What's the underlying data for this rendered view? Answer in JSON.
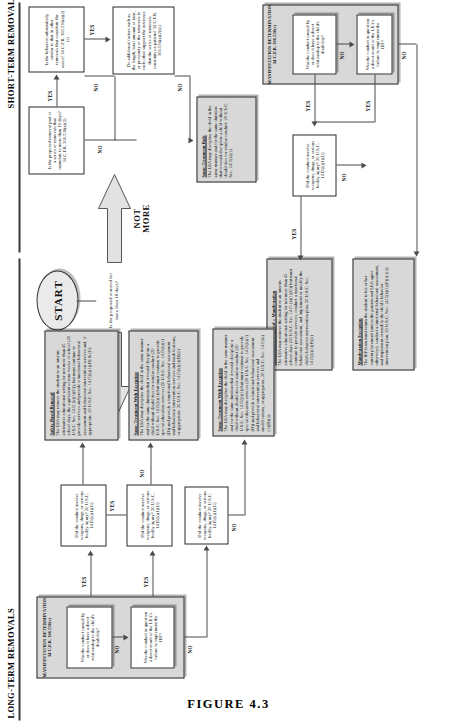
{
  "figure": {
    "caption": "FIGURE 4.3"
  },
  "bands": {
    "short_term": "SHORT-TERM REMOVALS",
    "long_term": "LONG-TERM REMOVALS"
  },
  "start": {
    "label": "START"
  },
  "split": {
    "more_label": "MORE",
    "not_more_label": "NOT\nMORE",
    "question": "Is the proposed removal for more than 10 days?"
  },
  "nodes": {
    "q_cumulate": {
      "text": "Is the proposed removal part of a series of removals that cumulate to more than 10 days? 34 C.F.R. 300.536(a)(2)"
    },
    "q_similar_behavior": {
      "text": "Is the behavior substantially similar to that in other removals that constitute the series? 34 C.F.R. 300.536(a)(2)(i)"
    },
    "q_additional_factors": {
      "text": "Do additional factors such as the length, total amount of time, or proximity of the removals to each other support the inference that the series of removals constitutes a pattern? 34 C.F.R. 300.536(a)(2)(ii)"
    },
    "q_caused_by_disability_short": {
      "text": "Was the conduct caused by or does it have a direct relationship to the child's disability?"
    },
    "q_failure_iep_short": {
      "text": "Was the conduct in question a direct result of the LEA's failure to implement the IEP?"
    },
    "q_weapons_short": {
      "text": "Did the conduct involve weapons, drugs, or serious bodily injury? 20 U.S.C. 1415(k)(1)(G)"
    },
    "q_caused_by_disability_long": {
      "text": "Was the conduct caused by or does it have a direct relationship to the child's disability?"
    },
    "q_failure_iep_long": {
      "text": "Was the conduct in question a direct result of the LEA's failure to implement the IEP?"
    },
    "q_weapons_long": {
      "text": "Did the conduct involve weapons, drugs, or serious bodily injury? 20 U.S.C. 1415(k)(1)(G)"
    }
  },
  "groups": {
    "md_short": {
      "title": "MANIFESTATION DETERMINATION\n34 C.F.R. 300.530(e)"
    },
    "md_long": {
      "title": "MANIFESTATION DETERMINATION\n34 C.F.R. 300.530(e)"
    }
  },
  "notes": {
    "same_treatment_rule": {
      "heading": "Same-Treatment Rule",
      "body": "The LEA may discipline the child in the same manner and for the same duration that it would discipline a child without disabilities for similar conduct. 20 U.S.C. Sec. 1415(k)(1)"
    },
    "safety_based_removal_manifestation": {
      "heading": "Safety-Based Removal + Manifestation",
      "body": "The LEA may remove the student to an interim alternative educational setting for not more than 45 school days (20 U.S.C. Sec. 1415 (k)(1)(G)) but must continue to provide services, conduct a functional behavioral assessment, and implement or modify the child's behavior intervention plan. 20 U.S.C. Sec. 1415(k)(1)(F)(ii)"
    },
    "manifestation_exception": {
      "heading": "Manifestation Exception",
      "body": "The IEP team must return the student to his or her current placement (unless the parents and LEA agree otherwise), conduct a functional behavioral assessment, and implement or modify the child's behavior intervention plan. 20 U.S.C. Sec. 1415(k)(1)(F)(i)-(iii)"
    },
    "safety_based_removal": {
      "heading": "Safety-Based Removal",
      "body": "The LEA may remove the student to an interim alternative educational setting for not more than 45 school days, the equivalent of nine weeks of school (20 U.S.C. Sec. 1415 (k)(1)(G)), but must continue to provide services and provide a functional behavioral assessment and behavioral intervention services and, if appropriate. 20 U.S.C. Sec. 1415(k)(1)(D) & (G)"
    },
    "same_treatment_with_exception": {
      "heading": "Same-Treatment With Exception",
      "body": "The LEA may discipline the child in the same manner and for the same duration that it would discipline a child without disabilities for similar conduct (20 U.S.C. Sec. 1415(k)(1)) but must continue to provide special education services (20 U.S.C. Sec. 1415(k)(1)(D)) and provide a functional behavioral assessment and behavioral intervention services and modifications, or appropriate. 20 U.S.C. Sec. 1415(k)(1)(D)(ii)"
    }
  },
  "edges": {
    "yes": "YES",
    "no": "NO"
  }
}
